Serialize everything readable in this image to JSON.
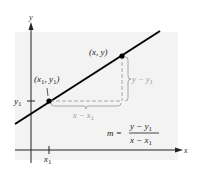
{
  "colors": {
    "background": "#ffffff",
    "panel": "#f2f2f2",
    "axis": "#222222",
    "line": "#000000",
    "dashed": "#a8a8a8",
    "gray_label": "#9a9a9a",
    "text": "#1a1a1a"
  },
  "axes": {
    "x_label": "x",
    "y_label": "y",
    "x_tick_label": "x",
    "x_tick_sub": "1",
    "y_tick_label": "y",
    "y_tick_sub": "1"
  },
  "points": {
    "p1": {
      "label_open": "(x",
      "label_sub1": "1",
      "label_mid": ", y",
      "label_sub2": "1",
      "label_close": ")"
    },
    "p2": {
      "label": "(x, y)"
    }
  },
  "brackets": {
    "rise": {
      "main": "y − y",
      "sub": "1"
    },
    "run": {
      "main": "x − x",
      "sub": "1"
    }
  },
  "formula": {
    "lhs": "m =",
    "numerator_main": "y − y",
    "numerator_sub": "1",
    "denominator_main": "x − x",
    "denominator_sub": "1"
  }
}
